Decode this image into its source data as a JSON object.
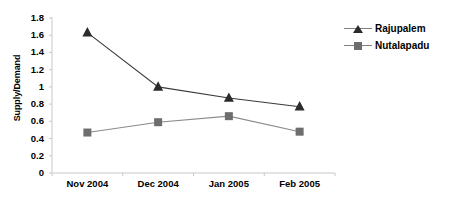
{
  "chart_data": {
    "type": "line",
    "title": "",
    "xlabel": "",
    "ylabel": "Supply/Demand",
    "categories": [
      "Nov 2004",
      "Dec 2004",
      "Jan 2005",
      "Feb 2005"
    ],
    "ylim": [
      0,
      1.8
    ],
    "ytick_step": 0.2,
    "ytick_labels": [
      "0",
      "0.2",
      "0.4",
      "0.6",
      "0.8",
      "1",
      "1.2",
      "1.4",
      "1.6",
      "1.8"
    ],
    "grid": false,
    "legend_position": "top-right",
    "series": [
      {
        "name": "Rajupalem",
        "marker": "triangle",
        "color": "#2b2b2b",
        "line_color": "#3a3a3a",
        "values": [
          1.63,
          1.0,
          0.87,
          0.77
        ]
      },
      {
        "name": "Nutalapadu",
        "marker": "square",
        "color": "#6e6e6e",
        "line_color": "#8a8a8a",
        "values": [
          0.47,
          0.59,
          0.66,
          0.48
        ]
      }
    ]
  },
  "colors": {
    "axis": "#c8c8c8",
    "background": "#ffffff",
    "series_1": "#2b2b2b",
    "series_2": "#6e6e6e"
  }
}
